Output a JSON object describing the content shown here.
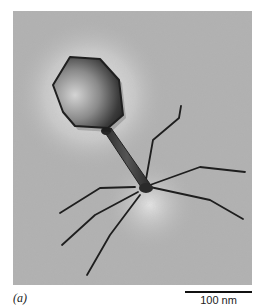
{
  "figure": {
    "panel_label": "(a)",
    "scale_bar": {
      "label": "100 nm"
    },
    "colors": {
      "background": "#b2b2b2",
      "halo": "#e8e8e8",
      "head_dark": "#2a2a2a",
      "fiber": "#1e1e1e"
    }
  }
}
